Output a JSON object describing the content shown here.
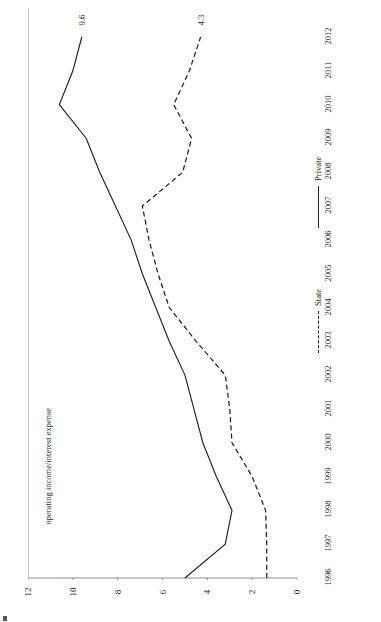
{
  "chart_data": {
    "type": "line",
    "title": "",
    "orientation": "rotated-90-ccw",
    "xlabel": "",
    "ylabel": "operating income/interest expense",
    "x": [
      1996,
      1997,
      1998,
      1999,
      2000,
      2001,
      2002,
      2003,
      2004,
      2005,
      2006,
      2007,
      2008,
      2009,
      2010,
      2011,
      2012
    ],
    "tick_labels": [
      "1996",
      "1997",
      "1998",
      "1999",
      "2000",
      "2001",
      "2002",
      "2003",
      "2004",
      "2005",
      "2006",
      "2007",
      "2008",
      "2009",
      "2010",
      "2011",
      "2012"
    ],
    "value_ticks": [
      "12",
      "10",
      "8",
      "6",
      "4",
      "2",
      "0"
    ],
    "value_tick_values": [
      12,
      10,
      8,
      6,
      4,
      2,
      0
    ],
    "ylim": [
      0,
      12
    ],
    "grid": false,
    "legend_position": "right",
    "series": [
      {
        "name": "Private",
        "style": "solid",
        "color": "#231f20",
        "values": [
          5.0,
          3.2,
          2.9,
          3.6,
          4.2,
          4.6,
          5.0,
          5.7,
          6.3,
          6.9,
          7.4,
          8.1,
          8.8,
          9.4,
          10.6,
          10.0,
          9.6
        ],
        "end_label": "9.6"
      },
      {
        "name": "State",
        "style": "dashed",
        "color": "#231f20",
        "values": [
          1.35,
          1.35,
          1.4,
          2.0,
          2.9,
          3.0,
          3.2,
          4.5,
          5.7,
          6.2,
          6.6,
          6.9,
          5.1,
          4.7,
          5.5,
          4.8,
          4.3
        ],
        "end_label": "4.3"
      }
    ],
    "annotations": [
      {
        "text": "9.6",
        "series": "Private",
        "at_year": 2012
      },
      {
        "text": "4.3",
        "series": "State",
        "at_year": 2012
      }
    ]
  },
  "legend": {
    "items": [
      {
        "label": "State",
        "style": "dashed"
      },
      {
        "label": "Private",
        "style": "solid"
      }
    ]
  }
}
